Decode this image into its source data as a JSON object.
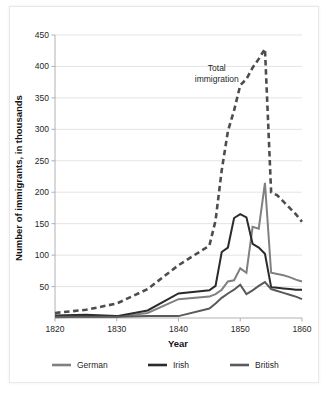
{
  "chart_data": {
    "type": "line",
    "title": "",
    "xlabel": "Year",
    "ylabel": "Number of immigrants, in thousands",
    "xlim": [
      1820,
      1860
    ],
    "ylim": [
      0,
      450
    ],
    "xticks": [
      "1820",
      "1830",
      "1840",
      "1850",
      "1860"
    ],
    "yticks": [
      "50",
      "100",
      "150",
      "200",
      "250",
      "300",
      "350",
      "400",
      "450"
    ],
    "grid": "horizontal",
    "legend_position": "bottom",
    "annotations": [
      {
        "name": "total-immigration-label",
        "text": "Total\nimmigration",
        "line1": "Total",
        "line2": "immigration",
        "x": 1846.2,
        "y": 392
      }
    ],
    "x": [
      1820,
      1825,
      1830,
      1835,
      1840,
      1845,
      1846,
      1847,
      1848,
      1849,
      1850,
      1851,
      1852,
      1853,
      1854,
      1855,
      1856,
      1857,
      1858,
      1859,
      1860
    ],
    "series": [
      {
        "name": "Total immigration",
        "legend_label": "",
        "style": "dashed",
        "color": "#4d4d4d",
        "in_legend": false,
        "values": [
          8,
          13,
          23,
          46,
          84,
          115,
          155,
          235,
          297,
          330,
          370,
          380,
          398,
          412,
          428,
          200,
          195,
          185,
          175,
          165,
          153
        ]
      },
      {
        "name": "German",
        "legend_label": "German",
        "style": "solid",
        "color": "#808080",
        "in_legend": true,
        "values": [
          1,
          2,
          2,
          8,
          30,
          34,
          38,
          45,
          58,
          60,
          79,
          72,
          145,
          142,
          215,
          72,
          70,
          68,
          65,
          61,
          58
        ]
      },
      {
        "name": "Irish",
        "legend_label": "Irish",
        "style": "solid",
        "color": "#2b2b2b",
        "in_legend": true,
        "values": [
          4,
          5,
          3,
          12,
          39,
          44,
          51,
          105,
          112,
          159,
          165,
          160,
          118,
          112,
          102,
          49,
          48,
          47,
          46,
          45,
          45
        ]
      },
      {
        "name": "British",
        "legend_label": "British",
        "style": "solid",
        "color": "#5a5a5a",
        "in_legend": true,
        "values": [
          2,
          2,
          2,
          3,
          3,
          15,
          23,
          32,
          39,
          45,
          53,
          38,
          44,
          51,
          57,
          46,
          43,
          40,
          37,
          34,
          30
        ]
      }
    ]
  },
  "legend": {
    "items": [
      {
        "label": "German",
        "color": "#808080"
      },
      {
        "label": "Irish",
        "color": "#2b2b2b"
      },
      {
        "label": "British",
        "color": "#5a5a5a"
      }
    ]
  }
}
